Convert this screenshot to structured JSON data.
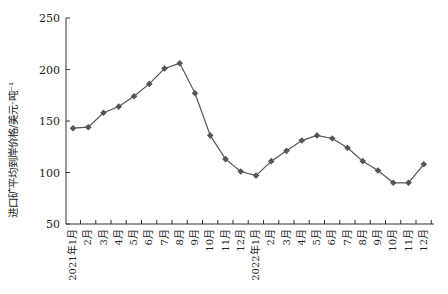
{
  "chart_data": {
    "type": "line",
    "title": "",
    "xlabel": "",
    "ylabel": "进口矿平均到岸价格/美元·吨⁻¹",
    "ylim": [
      50,
      250
    ],
    "yticks": [
      50,
      100,
      150,
      200,
      250
    ],
    "grid": false,
    "legend": null,
    "categories": [
      "2021年1月",
      "2月",
      "3月",
      "4月",
      "5月",
      "6月",
      "7月",
      "8月",
      "9月",
      "10月",
      "11月",
      "12月",
      "2022年1月",
      "2月",
      "3月",
      "4月",
      "5月",
      "6月",
      "7月",
      "8月",
      "9月",
      "10月",
      "11月",
      "12月"
    ],
    "series": [
      {
        "name": "进口矿平均到岸价格",
        "marker": "diamond",
        "color": "#555555",
        "values": [
          143,
          144,
          158,
          164,
          174,
          186,
          201,
          206,
          177,
          136,
          113,
          101,
          97,
          111,
          121,
          131,
          136,
          133,
          124,
          111,
          102,
          90,
          90,
          108
        ]
      }
    ]
  }
}
